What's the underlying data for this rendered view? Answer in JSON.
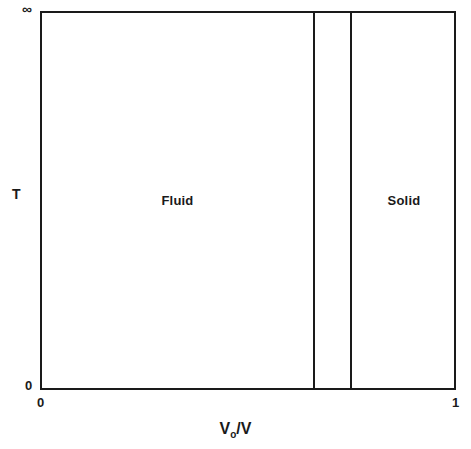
{
  "figure": {
    "title": "Figure II.15",
    "background_color": "#ffffff",
    "line_color": "#1a1a1a"
  },
  "axes": {
    "x": {
      "title_main": "V",
      "title_sub": "o",
      "title_rest": "/V",
      "title_full": "Vo/V",
      "tick_min": "0",
      "tick_max": "1"
    },
    "y": {
      "title": "T",
      "tick_min": "0",
      "tick_max": "∞"
    }
  },
  "regions": [
    {
      "name": "fluid",
      "label": "Fluid"
    },
    {
      "name": "solid",
      "label": "Solid"
    }
  ],
  "chart_data": {
    "type": "area",
    "title": "Figure II.15",
    "subtitle": "",
    "xlabel": "Vo/V",
    "ylabel": "T",
    "xlim": [
      0,
      1
    ],
    "ylim": [
      0,
      "∞"
    ],
    "x_tick_labels": [
      "0",
      "1"
    ],
    "y_tick_labels": [
      "0",
      "∞"
    ],
    "grid": false,
    "legend": "none",
    "phase_boundaries": [
      {
        "name": "fluid-freezing",
        "x": 0.656
      },
      {
        "name": "solid-melting",
        "x": 0.745
      }
    ],
    "regions": [
      {
        "label": "Fluid",
        "x_start": 0.0,
        "x_end": 0.656,
        "label_x": 0.326,
        "label_y": 0.5
      },
      {
        "label": "coexistence",
        "x_start": 0.656,
        "x_end": 0.745,
        "label_x": 0.7,
        "label_y": 0.5
      },
      {
        "label": "Solid",
        "x_start": 0.745,
        "x_end": 1.0,
        "label_x": 0.872,
        "label_y": 0.5
      }
    ],
    "series": [
      {
        "name": "freezing boundary",
        "x": [
          0.656,
          0.656
        ],
        "y": [
          0,
          1
        ]
      },
      {
        "name": "melting boundary",
        "x": [
          0.745,
          0.745
        ],
        "y": [
          0,
          1
        ]
      }
    ],
    "annotations": [
      {
        "text": "Figure II.15",
        "x": 0.07,
        "y": 0.91
      },
      {
        "text": "Fluid",
        "x": 0.326,
        "y": 0.5
      },
      {
        "text": "Solid",
        "x": 0.872,
        "y": 0.5
      }
    ]
  }
}
